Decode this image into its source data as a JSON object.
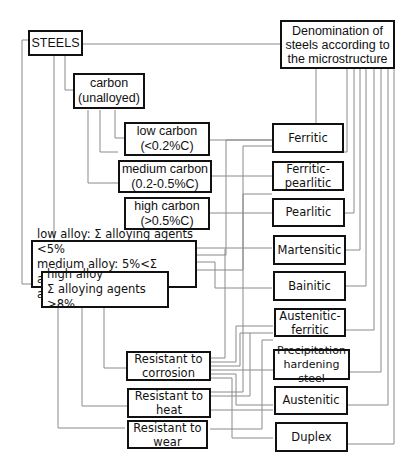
{
  "diagram": {
    "root": {
      "label": "STEELS"
    },
    "microstructure_header": {
      "label": "Denomination of\nsteels according to\nthe microstructure"
    },
    "composition": {
      "carbon": {
        "label": "carbon\n(unalloyed)"
      },
      "low_carbon": {
        "label": "low carbon\n(<0.2%C)"
      },
      "medium_carbon": {
        "label": "medium carbon\n(0.2-0.5%C)"
      },
      "high_carbon": {
        "label": "high carbon\n(>0.5%C)"
      },
      "low_medium_alloy": {
        "label": "low alloy: Σ alloying agents <5%\nmedium alloy: 5%<Σ alloying\nagents<8%"
      },
      "high_alloy": {
        "label": "high alloy\nΣ alloying agents >8%"
      },
      "resistant_corrosion": {
        "label": "Resistant to\ncorrosion"
      },
      "resistant_heat": {
        "label": "Resistant to\nheat"
      },
      "resistant_wear": {
        "label": "Resistant to\nwear"
      }
    },
    "microstructures": [
      {
        "label": "Ferritic"
      },
      {
        "label": "Ferritic-\npearlitic"
      },
      {
        "label": "Pearlitic"
      },
      {
        "label": "Martensitic"
      },
      {
        "label": "Bainitic"
      },
      {
        "label": "Austenitic-\nferritic"
      },
      {
        "label": "Precipitation\nhardening steel"
      },
      {
        "label": "Austenitic"
      },
      {
        "label": "Duplex"
      }
    ],
    "colors": {
      "box_border": "#111111",
      "connector": "#8a8a8a",
      "background": "#ffffff"
    }
  }
}
